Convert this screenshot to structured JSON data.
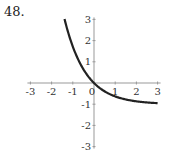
{
  "problem_number": "48.",
  "chart_data": {
    "type": "line",
    "title": "",
    "xlabel": "",
    "ylabel": "",
    "xlim": [
      -3,
      3
    ],
    "ylim": [
      -3,
      3
    ],
    "xticks": [
      "-3",
      "-2",
      "-1",
      "0",
      "1",
      "2",
      "3"
    ],
    "yticks": [
      "3",
      "2",
      "1",
      "-1",
      "-2",
      "-3"
    ],
    "grid": false,
    "legend": null,
    "series": [
      {
        "name": "curve",
        "color": "#222222",
        "x": [
          -1.39,
          -1.2,
          -1.0,
          -0.75,
          -0.5,
          -0.25,
          0,
          0.25,
          0.5,
          0.75,
          1.0,
          1.5,
          2.0,
          2.5,
          3.0
        ],
        "y": [
          3.0,
          2.32,
          1.72,
          1.12,
          0.65,
          0.28,
          0,
          -0.22,
          -0.39,
          -0.53,
          -0.63,
          -0.78,
          -0.86,
          -0.92,
          -0.95
        ]
      }
    ]
  }
}
